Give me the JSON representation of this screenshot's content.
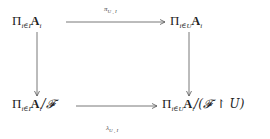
{
  "diagram": {
    "nodes": {
      "top_left": {
        "pi": "Π",
        "sub": "i∈I",
        "base": "A",
        "base_sub": "i",
        "suffix": ""
      },
      "top_right": {
        "pi": "Π",
        "sub": "i∈U",
        "base": "A",
        "base_sub": "i",
        "suffix": ""
      },
      "bottom_left": {
        "pi": "Π",
        "sub": "i∈I",
        "base": "A",
        "base_sub": "i",
        "suffix": "/𝓕"
      },
      "bottom_right": {
        "pi": "Π",
        "sub": "i∈U",
        "base": "A",
        "base_sub": "i",
        "suffix": "/(𝓕 ↾ U)"
      }
    },
    "arrows": {
      "top": {
        "label": "π",
        "label_sub": "U , I",
        "from": "top_left",
        "to": "top_right"
      },
      "bottom": {
        "label": "λ",
        "label_sub": "U , I",
        "from": "bottom_left",
        "to": "bottom_right"
      },
      "left": {
        "label": "",
        "from": "top_left",
        "to": "bottom_left"
      },
      "right": {
        "label": "",
        "from": "top_right",
        "to": "bottom_right"
      }
    }
  }
}
